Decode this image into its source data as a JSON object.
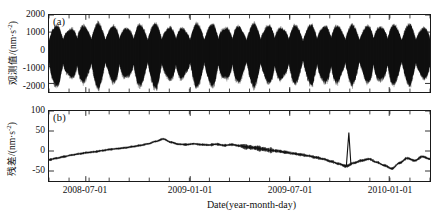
{
  "figure": {
    "xlabel": "Date(year-month-day)",
    "x_tick_labels": [
      "2008-07-01",
      "2009-01-01",
      "2009-07-01",
      "2010-01-01"
    ],
    "x_tick_positions": [
      85,
      190,
      290,
      390
    ],
    "x_minor_count": 19
  },
  "panel_a": {
    "tag": "(a)",
    "ylabel_main": "观测值/(nm·s",
    "ylabel_sup": "-2",
    "ylabel_tail": ")",
    "y_ticks": [
      "2000",
      "1000",
      "0",
      "-1000",
      "-2000"
    ]
  },
  "panel_b": {
    "tag": "(b)",
    "ylabel_main": "残差/(nm·s",
    "ylabel_sup": "-2",
    "ylabel_tail": ")",
    "y_ticks": [
      "100",
      "50",
      "0",
      "-50"
    ]
  },
  "chart_data": {
    "type": "line",
    "title": "",
    "xlabel": "Date(year-month-day)",
    "panels": [
      {
        "id": "a",
        "tag": "(a)",
        "ylabel": "观测值/(nm·s-2)",
        "ylim": [
          -2500,
          2000
        ],
        "y_ticks": [
          2000,
          1000,
          0,
          -1000,
          -2000
        ],
        "description": "Dense gravity tide observation time series; high-frequency diurnal/semidiurnal oscillation with spring-neap envelope modulation; envelope amplitude varies roughly 900 to 2300 nm/s^2.",
        "series_name": "observed gravity",
        "envelope_upper": [
          1200,
          1450,
          1100,
          1500,
          1250,
          1550,
          1200,
          1480,
          1150,
          1520,
          1230,
          1560,
          1180,
          1440,
          1120,
          1500,
          1260,
          1540,
          1190,
          1470,
          1140,
          1510,
          1240,
          1530,
          1170,
          1460,
          1130,
          1490,
          1270,
          1550,
          1200,
          1450,
          1160,
          1500,
          1250,
          1520,
          1190,
          1480,
          1140,
          1460
        ],
        "envelope_lower": [
          -1900,
          -2300,
          -1500,
          -2250,
          -1700,
          -2350,
          -1600,
          -2200,
          -1550,
          -2300,
          -1750,
          -2400,
          -1620,
          -2150,
          -1500,
          -2280,
          -1800,
          -2330,
          -1650,
          -2200,
          -1560,
          -2260,
          -1720,
          -2310,
          -1600,
          -2180,
          -1520,
          -2240,
          -1830,
          -2350,
          -1640,
          -2160,
          -1540,
          -2250,
          -1760,
          -2290,
          -1610,
          -2200,
          -1530,
          -2170
        ]
      },
      {
        "id": "b",
        "tag": "(b)",
        "ylabel": "残差/(nm·s-2)",
        "ylim": [
          -75,
          100
        ],
        "y_ticks": [
          100,
          50,
          0,
          -50
        ],
        "description": "Residual after tidal model removal; slow drift rising from about -22 to +28 by 2008-09, plateau near +15, decline to -20 by 2009-06, noisy dip to -45, sharp jump to +45 at 2009-07, broad maximum near +48, decay with a spike at 2009-12, settling near -45 through 2010.",
        "series_name": "residual",
        "x": [
          0,
          2,
          4,
          6,
          8,
          10,
          12,
          14,
          16,
          18,
          20,
          22,
          24,
          26,
          28,
          30,
          32,
          34,
          36,
          38,
          40,
          42,
          44,
          46,
          48,
          50,
          52,
          54,
          56,
          58,
          60,
          62,
          64,
          66,
          68,
          70,
          72,
          74,
          76,
          78,
          80,
          82,
          84,
          86,
          88,
          90,
          92,
          94,
          96,
          98,
          100
        ],
        "values": [
          -22,
          -18,
          -14,
          -10,
          -7,
          -4,
          -2,
          1,
          4,
          6,
          8,
          11,
          14,
          18,
          24,
          30,
          22,
          17,
          16,
          18,
          16,
          15,
          17,
          14,
          16,
          13,
          10,
          8,
          5,
          2,
          0,
          -3,
          -6,
          -9,
          -12,
          -16,
          -20,
          -26,
          -32,
          -38,
          -30,
          -24,
          -20,
          -28,
          -36,
          -44,
          -30,
          -18,
          -24,
          -14,
          -20
        ]
      }
    ]
  }
}
